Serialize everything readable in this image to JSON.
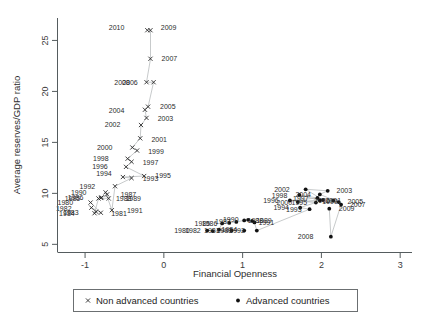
{
  "chart_data": {
    "type": "scatter",
    "title": "",
    "xlabel": "Financial Openness",
    "ylabel": "Average reserves/GDP ratio",
    "xlim": [
      -1.35,
      3.15
    ],
    "ylim": [
      4.2,
      27.2
    ],
    "xticks": [
      -1,
      0,
      1,
      2,
      3
    ],
    "xtick_labels": [
      "-1",
      "0",
      "1",
      "2",
      "3"
    ],
    "yticks": [
      5,
      10,
      15,
      20,
      25
    ],
    "ytick_labels": [
      "5",
      "10",
      "15",
      "20",
      "25"
    ],
    "grid": false,
    "legend_position": "below-axis",
    "series": [
      {
        "name": "Non advanced countries",
        "marker": "x",
        "connected": true,
        "color": "#2b2b2b",
        "points": [
          {
            "label": "1980",
            "x": -0.93,
            "y": 9.1,
            "lx": -1.12,
            "ly": 9.1
          },
          {
            "label": "1981",
            "x": -0.8,
            "y": 8.1,
            "lx": -0.7,
            "ly": 8.0
          },
          {
            "label": "1982",
            "x": -0.92,
            "y": 8.6,
            "lx": -1.14,
            "ly": 8.5
          },
          {
            "label": "1983",
            "x": -0.86,
            "y": 8.2,
            "lx": -1.05,
            "ly": 8.1
          },
          {
            "label": "1984",
            "x": -0.88,
            "y": 8.05,
            "lx": -1.1,
            "ly": 8.0
          },
          {
            "label": "1985",
            "x": -0.83,
            "y": 9.5,
            "lx": -1.03,
            "ly": 9.45
          },
          {
            "label": "1986",
            "x": -0.79,
            "y": 9.6,
            "lx": -0.99,
            "ly": 9.6
          },
          {
            "label": "1987",
            "x": -0.72,
            "y": 9.9,
            "lx": -0.58,
            "ly": 9.9
          },
          {
            "label": "1988",
            "x": -0.8,
            "y": 9.55,
            "lx": -0.64,
            "ly": 9.5
          },
          {
            "label": "1989",
            "x": -0.7,
            "y": 9.5,
            "lx": -0.52,
            "ly": 9.45
          },
          {
            "label": "1990",
            "x": -0.74,
            "y": 10.1,
            "lx": -0.95,
            "ly": 10.1
          },
          {
            "label": "1991",
            "x": -0.66,
            "y": 8.35,
            "lx": -0.5,
            "ly": 8.3
          },
          {
            "label": "1992",
            "x": -0.62,
            "y": 10.7,
            "lx": -0.84,
            "ly": 10.7
          },
          {
            "label": "1993",
            "x": -0.41,
            "y": 11.5,
            "lx": -0.3,
            "ly": 11.4
          },
          {
            "label": "1994",
            "x": -0.52,
            "y": 11.6,
            "lx": -0.63,
            "ly": 11.9
          },
          {
            "label": "1995",
            "x": -0.25,
            "y": 11.7,
            "lx": -0.14,
            "ly": 11.7
          },
          {
            "label": "1996",
            "x": -0.48,
            "y": 12.6,
            "lx": -0.68,
            "ly": 12.6
          },
          {
            "label": "1997",
            "x": -0.41,
            "y": 13.1,
            "lx": -0.3,
            "ly": 13.0
          },
          {
            "label": "1998",
            "x": -0.46,
            "y": 13.4,
            "lx": -0.67,
            "ly": 13.4
          },
          {
            "label": "1999",
            "x": -0.34,
            "y": 14.2,
            "lx": -0.23,
            "ly": 14.1
          },
          {
            "label": "2000",
            "x": -0.4,
            "y": 14.5,
            "lx": -0.62,
            "ly": 14.5
          },
          {
            "label": "2001",
            "x": -0.3,
            "y": 15.4,
            "lx": -0.19,
            "ly": 15.3
          },
          {
            "label": "2002",
            "x": -0.29,
            "y": 16.7,
            "lx": -0.52,
            "ly": 16.7
          },
          {
            "label": "2003",
            "x": -0.22,
            "y": 17.4,
            "lx": -0.11,
            "ly": 17.3
          },
          {
            "label": "2004",
            "x": -0.24,
            "y": 18.2,
            "lx": -0.47,
            "ly": 18.1
          },
          {
            "label": "2005",
            "x": -0.2,
            "y": 18.5,
            "lx": -0.08,
            "ly": 18.5
          },
          {
            "label": "2006",
            "x": -0.13,
            "y": 20.9,
            "lx": -0.3,
            "ly": 20.9
          },
          {
            "label": "2008",
            "x": -0.22,
            "y": 20.9,
            "lx": -0.4,
            "ly": 20.9
          },
          {
            "label": "2007",
            "x": -0.17,
            "y": 23.2,
            "lx": -0.06,
            "ly": 23.2
          },
          {
            "label": "2009",
            "x": -0.17,
            "y": 26.0,
            "lx": -0.07,
            "ly": 26.2
          },
          {
            "label": "2010",
            "x": -0.21,
            "y": 26.0,
            "lx": -0.47,
            "ly": 26.2
          }
        ]
      },
      {
        "name": "Advanced countries",
        "marker": "dot",
        "connected": true,
        "color": "#111111",
        "points": [
          {
            "label": "1980",
            "x": 0.55,
            "y": 6.35,
            "lx": 0.36,
            "ly": 6.3
          },
          {
            "label": "1981",
            "x": 0.86,
            "y": 6.35,
            "lx": 0.74,
            "ly": 6.3
          },
          {
            "label": "1982",
            "x": 0.62,
            "y": 6.3,
            "lx": 0.5,
            "ly": 6.3
          },
          {
            "label": "1983",
            "x": 1.02,
            "y": 6.35,
            "lx": 0.9,
            "ly": 6.3
          },
          {
            "label": "1984",
            "x": 0.7,
            "y": 6.45,
            "lx": 0.7,
            "ly": 6.45
          },
          {
            "label": "1985",
            "x": 0.74,
            "y": 7.05,
            "lx": 0.62,
            "ly": 7.0
          },
          {
            "label": "1986",
            "x": 0.83,
            "y": 7.1,
            "lx": 0.71,
            "ly": 7.05
          },
          {
            "label": "1987",
            "x": 0.92,
            "y": 7.2,
            "lx": 0.88,
            "ly": 7.2
          },
          {
            "label": "1988",
            "x": 1.02,
            "y": 7.35,
            "lx": 1.03,
            "ly": 7.3
          },
          {
            "label": "1989",
            "x": 1.12,
            "y": 7.3,
            "lx": 1.14,
            "ly": 7.3
          },
          {
            "label": "1990",
            "x": 1.07,
            "y": 7.4,
            "lx": 0.98,
            "ly": 7.4
          },
          {
            "label": "1991",
            "x": 1.15,
            "y": 7.15,
            "lx": 1.17,
            "ly": 7.1
          },
          {
            "label": "1992",
            "x": 1.18,
            "y": 6.35,
            "lx": 1.06,
            "ly": 6.3
          },
          {
            "label": "1993",
            "x": 1.85,
            "y": 8.45,
            "lx": 1.78,
            "ly": 8.35
          },
          {
            "label": "1994",
            "x": 1.73,
            "y": 8.6,
            "lx": 1.62,
            "ly": 8.6
          },
          {
            "label": "1995",
            "x": 1.93,
            "y": 9.1,
            "lx": 1.85,
            "ly": 9.05
          },
          {
            "label": "1996",
            "x": 1.6,
            "y": 9.3,
            "lx": 1.49,
            "ly": 9.3
          },
          {
            "label": "1997",
            "x": 1.95,
            "y": 9.55,
            "lx": 1.87,
            "ly": 9.5
          },
          {
            "label": "1998",
            "x": 1.72,
            "y": 9.85,
            "lx": 1.6,
            "ly": 9.8
          },
          {
            "label": "1999",
            "x": 1.98,
            "y": 9.3,
            "lx": 1.98,
            "ly": 9.2
          },
          {
            "label": "2000",
            "x": 1.7,
            "y": 9.15,
            "lx": 1.66,
            "ly": 9.1
          },
          {
            "label": "2001",
            "x": 2.02,
            "y": 9.35,
            "lx": 2.02,
            "ly": 9.3
          },
          {
            "label": "2002",
            "x": 1.8,
            "y": 10.4,
            "lx": 1.63,
            "ly": 10.4
          },
          {
            "label": "2003",
            "x": 2.08,
            "y": 10.25,
            "lx": 2.16,
            "ly": 10.25
          },
          {
            "label": "2004",
            "x": 1.98,
            "y": 9.9,
            "lx": 1.9,
            "ly": 9.85
          },
          {
            "label": "2005",
            "x": 2.22,
            "y": 9.15,
            "lx": 2.3,
            "ly": 9.15
          },
          {
            "label": "2006",
            "x": 2.15,
            "y": 9.3,
            "lx": 2.14,
            "ly": 9.3
          },
          {
            "label": "2007",
            "x": 2.25,
            "y": 8.9,
            "lx": 2.33,
            "ly": 8.85
          },
          {
            "label": "2008",
            "x": 2.12,
            "y": 5.75,
            "lx": 1.93,
            "ly": 5.75
          },
          {
            "label": "2009",
            "x": 2.1,
            "y": 8.5,
            "lx": 2.19,
            "ly": 8.45
          }
        ]
      }
    ],
    "legend": [
      {
        "label": "Non advanced countries",
        "marker": "x"
      },
      {
        "label": "Advanced countries",
        "marker": "dot"
      }
    ]
  }
}
